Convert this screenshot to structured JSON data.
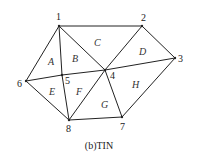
{
  "diagram": {
    "type": "triangulated-irregular-network",
    "caption": "(b)TIN",
    "stroke_color": "#222222",
    "vertices": [
      {
        "id": "1",
        "x": 59,
        "y": 26,
        "label_x": 56,
        "label_y": 20
      },
      {
        "id": "2",
        "x": 142,
        "y": 26,
        "label_x": 141,
        "label_y": 21
      },
      {
        "id": "3",
        "x": 175,
        "y": 58,
        "label_x": 178,
        "label_y": 62
      },
      {
        "id": "4",
        "x": 105,
        "y": 70,
        "label_x": 110,
        "label_y": 79
      },
      {
        "id": "5",
        "x": 62,
        "y": 75,
        "label_x": 65,
        "label_y": 84
      },
      {
        "id": "6",
        "x": 26,
        "y": 81,
        "label_x": 17,
        "label_y": 87
      },
      {
        "id": "7",
        "x": 122,
        "y": 117,
        "label_x": 120,
        "label_y": 130
      },
      {
        "id": "8",
        "x": 69,
        "y": 120,
        "label_x": 66,
        "label_y": 132
      }
    ],
    "edges": [
      [
        "1",
        "2"
      ],
      [
        "2",
        "3"
      ],
      [
        "3",
        "7"
      ],
      [
        "7",
        "8"
      ],
      [
        "8",
        "6"
      ],
      [
        "6",
        "1"
      ],
      [
        "1",
        "4"
      ],
      [
        "1",
        "5"
      ],
      [
        "2",
        "4"
      ],
      [
        "3",
        "4"
      ],
      [
        "4",
        "7"
      ],
      [
        "4",
        "8"
      ],
      [
        "5",
        "8"
      ],
      [
        "6",
        "5"
      ],
      [
        "5",
        "4"
      ]
    ],
    "regions": [
      {
        "id": "A",
        "x": 48,
        "y": 65
      },
      {
        "id": "B",
        "x": 72,
        "y": 62
      },
      {
        "id": "C",
        "x": 94,
        "y": 46
      },
      {
        "id": "D",
        "x": 139,
        "y": 55
      },
      {
        "id": "E",
        "x": 49,
        "y": 95
      },
      {
        "id": "F",
        "x": 76,
        "y": 95
      },
      {
        "id": "G",
        "x": 101,
        "y": 108
      },
      {
        "id": "H",
        "x": 132,
        "y": 88
      }
    ],
    "caption_x": 99,
    "caption_y": 149
  }
}
